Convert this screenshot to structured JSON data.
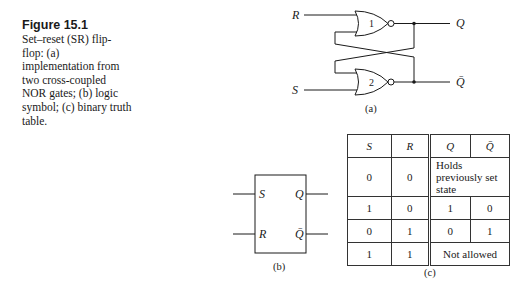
{
  "caption": {
    "title": "Figure 15.1",
    "text": "Set–reset (SR) flip-flop: (a) implementation from two cross-coupled NOR gates; (b) logic symbol; (c) binary truth table."
  },
  "diagram_a": {
    "label": "(a)",
    "inputs": {
      "top": "R",
      "bottom": "S"
    },
    "outputs": {
      "top": "Q",
      "bottom": "Q̄"
    },
    "gates": [
      {
        "id": "1",
        "type": "NOR"
      },
      {
        "id": "2",
        "type": "NOR"
      }
    ]
  },
  "diagram_b": {
    "label": "(b)",
    "pins": {
      "left_top": "S",
      "left_bottom": "R",
      "right_top": "Q",
      "right_bottom": "Q̄"
    }
  },
  "table_c": {
    "label": "(c)",
    "headers": [
      "S",
      "R",
      "Q",
      "Q̄"
    ],
    "rows": [
      {
        "s": "0",
        "r": "0",
        "merged": "Holds previously set state"
      },
      {
        "s": "1",
        "r": "0",
        "q": "1",
        "qbar": "0"
      },
      {
        "s": "0",
        "r": "1",
        "q": "0",
        "qbar": "1"
      },
      {
        "s": "1",
        "r": "1",
        "merged": "Not allowed"
      }
    ]
  }
}
